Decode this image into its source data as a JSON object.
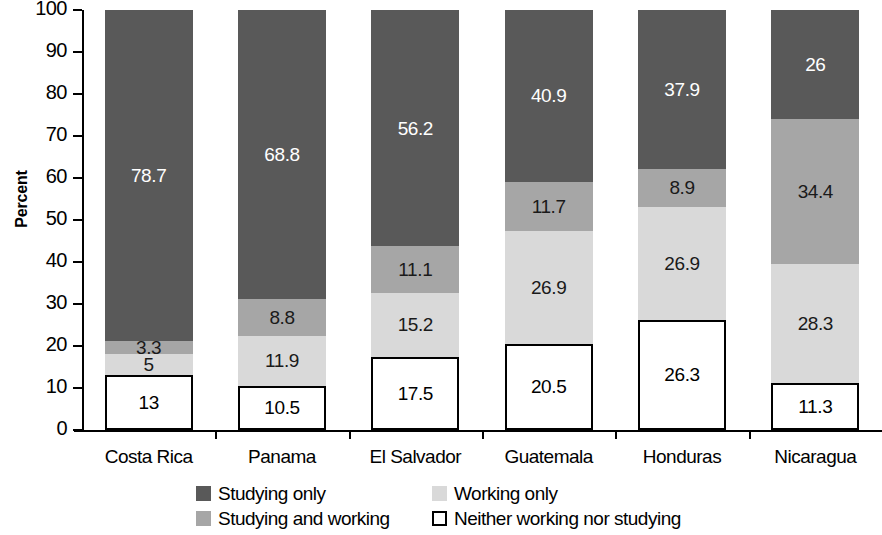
{
  "chart_data": {
    "type": "bar",
    "subtype": "stacked-bar-100",
    "title": "",
    "xlabel": "",
    "ylabel": "Percent",
    "ylim": [
      0,
      100
    ],
    "ytick_step": 10,
    "yticks": [
      100,
      90,
      80,
      70,
      60,
      50,
      40,
      30,
      20,
      10,
      0
    ],
    "grid": false,
    "legend_position": "bottom",
    "categories": [
      "Costa Rica",
      "Panama",
      "El Salvador",
      "Guatemala",
      "Honduras",
      "Nicaragua"
    ],
    "series": [
      {
        "name": "Studying only",
        "key": "studying_only",
        "color": "#595959",
        "values": [
          78.7,
          68.8,
          56.2,
          40.9,
          37.9,
          26
        ],
        "labels": [
          "78.7",
          "68.8",
          "56.2",
          "40.9",
          "37.9",
          "26"
        ]
      },
      {
        "name": "Studying and working",
        "key": "studying_working",
        "color": "#a6a6a6",
        "values": [
          3.3,
          8.8,
          11.1,
          11.7,
          8.9,
          34.4
        ],
        "labels": [
          "3.3",
          "8.8",
          "11.1",
          "11.7",
          "8.9",
          "34.4"
        ]
      },
      {
        "name": "Working only",
        "key": "working_only",
        "color": "#d9d9d9",
        "values": [
          5,
          11.9,
          15.2,
          26.9,
          26.9,
          28.3
        ],
        "labels": [
          "5",
          "11.9",
          "15.2",
          "26.9",
          "26.9",
          "28.3"
        ]
      },
      {
        "name": "Neither working nor studying",
        "key": "neither",
        "color": "#ffffff",
        "values": [
          13,
          10.5,
          17.5,
          20.5,
          26.3,
          11.3
        ],
        "labels": [
          "13",
          "10.5",
          "17.5",
          "20.5",
          "26.3",
          "11.3"
        ]
      }
    ]
  },
  "axis": {
    "y_title": "Percent",
    "y_tick_labels": [
      "100",
      "90",
      "80",
      "70",
      "60",
      "50",
      "40",
      "30",
      "20",
      "10",
      "0"
    ]
  },
  "legend": {
    "items": [
      {
        "label": "Studying only",
        "key": "studying_only"
      },
      {
        "label": "Working only",
        "key": "working_only"
      },
      {
        "label": "Studying and working",
        "key": "studying_working"
      },
      {
        "label": "Neither working nor studying",
        "key": "neither"
      }
    ]
  }
}
